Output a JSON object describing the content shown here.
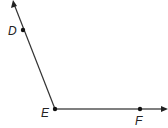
{
  "diagram": {
    "type": "angle",
    "vertex": {
      "label": "E",
      "x": 55,
      "y": 109
    },
    "points": [
      {
        "label": "D",
        "x": 23,
        "y": 30
      },
      {
        "label": "F",
        "x": 140,
        "y": 109
      }
    ],
    "rays": [
      {
        "name": "ray-ED",
        "from": "E",
        "through": "D",
        "end": {
          "x": 13,
          "y": 1
        }
      },
      {
        "name": "ray-EF",
        "from": "E",
        "through": "F",
        "end": {
          "x": 167,
          "y": 109
        }
      }
    ],
    "colors": {
      "line": "#333333",
      "ray_ef": "#555555",
      "point": "#111111"
    }
  }
}
